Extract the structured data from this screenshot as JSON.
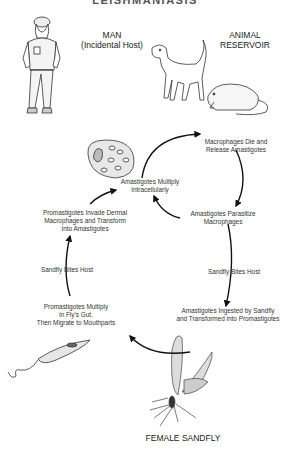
{
  "title": "LEISHMANIASIS",
  "hosts": {
    "man": {
      "line1": "MAN",
      "line2": "(Incidental Host)"
    },
    "animal": {
      "line1": "ANIMAL",
      "line2": "RESERVOIR"
    },
    "vector": "FEMALE SANDFLY"
  },
  "stages": {
    "macrophages_die": [
      "Macrophages Die and",
      "Release Amastigotes"
    ],
    "amastigotes_multiply": [
      "Amastigotes Multiply",
      "Intracellularly"
    ],
    "amastigotes_parasitize": [
      "Amastigotes Parasitize",
      "Macrophages"
    ],
    "bite_host_right": "Sandfly Bites Host",
    "ingested": [
      "Amastigotes Ingested by Sandfly",
      "and Transformed into Promastigotes"
    ],
    "promastigotes_invade": [
      "Promastigotes Invade Dermal",
      "Macrophages and Transform",
      "Into Amastigotes"
    ],
    "bite_host_left": "Sandfly Bites Host",
    "promastigotes_multiply": [
      "Promastigotes Multiply",
      "in Fly's Gut.",
      "Then Migrate to Mouthparts"
    ]
  },
  "illustrations": [
    "soldier-figure",
    "dog",
    "rat",
    "infected-macrophage-cell",
    "promastigote",
    "sandfly"
  ],
  "colors": {
    "line": "#111111",
    "text": "#333333",
    "background": "#ffffff"
  }
}
